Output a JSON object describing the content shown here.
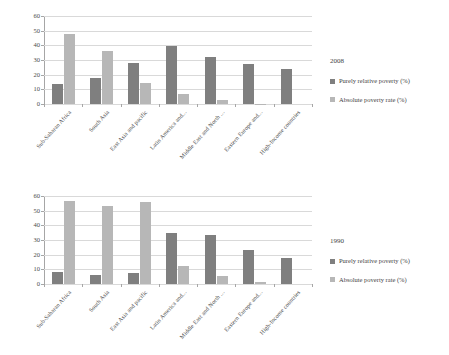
{
  "charts": [
    {
      "id": "chart-2008",
      "legend_title": "2008",
      "series_labels": {
        "dark": "Purely relative poverty (%)",
        "light": "Absolute poverty rate (%)"
      }
    },
    {
      "id": "chart-1990",
      "legend_title": "1990",
      "series_labels": {
        "dark": "Purely relative poverty (%)",
        "light": "Absolute poverty rate (%)"
      }
    }
  ],
  "colors": {
    "dark_series": "#7f7f7f",
    "light_series": "#b7b7b7",
    "gridline": "#d9d9d9",
    "axis": "#a6a6a6",
    "text": "#3f3f3f",
    "background": "#ffffff"
  },
  "chart_data": [
    {
      "type": "bar",
      "title": "2008",
      "xlabel": "",
      "ylabel": "",
      "ylim": [
        0,
        60
      ],
      "yticks": [
        0,
        10,
        20,
        30,
        40,
        50,
        60
      ],
      "grid": true,
      "legend_position": "right",
      "categories": [
        "Sub-Saharan Africa",
        "South Asia",
        "East Asia and pacific",
        "Latin America and...",
        "Middle East and North ...",
        "Eastern Europe and...",
        "High-Income countries"
      ],
      "series": [
        {
          "name": "Purely relative poverty (%)",
          "color": "#7f7f7f",
          "values": [
            13.6,
            17.4,
            28.1,
            39.7,
            32.1,
            27.5,
            23.8
          ]
        },
        {
          "name": "Absolute poverty rate (%)",
          "color": "#b7b7b7",
          "values": [
            47.5,
            35.9,
            14.3,
            6.5,
            2.7,
            0.3,
            0.0
          ]
        }
      ]
    },
    {
      "type": "bar",
      "title": "1990",
      "xlabel": "",
      "ylabel": "",
      "ylim": [
        0,
        60
      ],
      "yticks": [
        0,
        10,
        20,
        30,
        40,
        50,
        60
      ],
      "grid": true,
      "legend_position": "right",
      "categories": [
        "Sub-Saharan Africa",
        "South Asia",
        "East Asia and pacific",
        "Latin America and...",
        "Middle East and North ...",
        "Eastern Europe and...",
        "High-Income countries"
      ],
      "series": [
        {
          "name": "Purely relative poverty (%)",
          "color": "#7f7f7f",
          "values": [
            8.3,
            6.3,
            7.7,
            34.6,
            33.7,
            23.5,
            17.8
          ]
        },
        {
          "name": "Absolute poverty rate (%)",
          "color": "#b7b7b7",
          "values": [
            56.5,
            53.4,
            56.0,
            12.3,
            5.8,
            1.7,
            0.0
          ]
        }
      ]
    }
  ]
}
